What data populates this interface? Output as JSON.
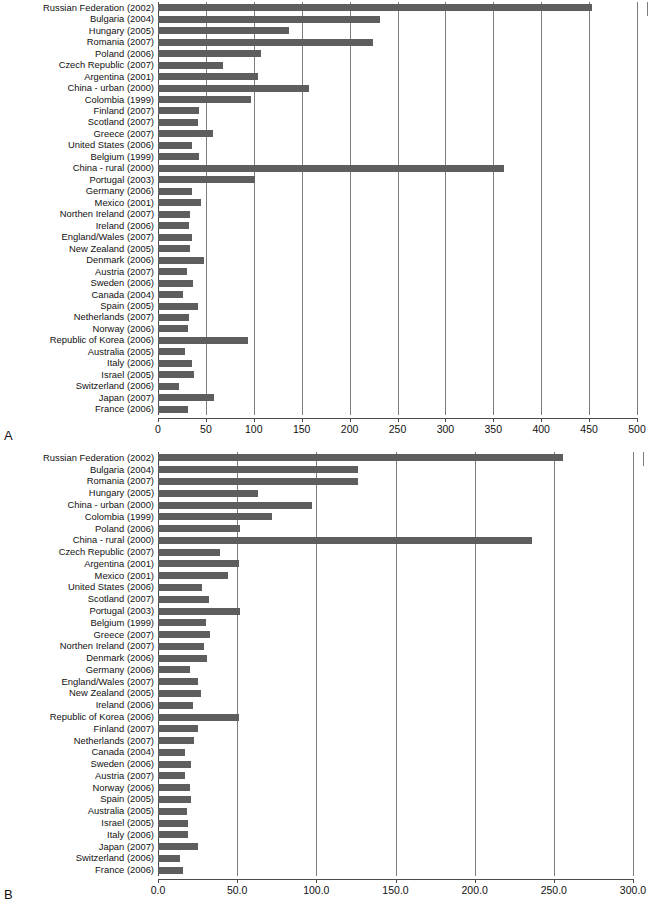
{
  "figure": {
    "panels": [
      {
        "letter": "A"
      },
      {
        "letter": "B"
      }
    ]
  },
  "chart_data": [
    {
      "panel": "A",
      "type": "bar",
      "orientation": "horizontal",
      "title": "",
      "xlabel": "",
      "ylabel": "",
      "xlim": [
        0,
        500
      ],
      "xticks": [
        0,
        50,
        100,
        150,
        200,
        250,
        300,
        350,
        400,
        450,
        500
      ],
      "xticklabels": [
        "0",
        "50",
        "100",
        "150",
        "200",
        "250",
        "300",
        "350",
        "400",
        "450",
        "500"
      ],
      "grid": true,
      "legend": "none",
      "bar_color": "#5e5e5e",
      "categories": [
        "Russian Federation (2002)",
        "Bulgaria (2004)",
        "Hungary (2005)",
        "Romania (2007)",
        "Poland (2006)",
        "Czech Republic (2007)",
        "Argentina (2001)",
        "China - urban (2000)",
        "Colombia (1999)",
        "Finland (2007)",
        "Scotland (2007)",
        "Greece (2007)",
        "United States (2006)",
        "Belgium (1999)",
        "China - rural (2000)",
        "Portugal (2003)",
        "Germany (2006)",
        "Mexico (2001)",
        "Northen Ireland (2007)",
        "Ireland (2006)",
        "England/Wales (2007)",
        "New Zealand (2005)",
        "Denmark (2006)",
        "Austria (2007)",
        "Sweden (2006)",
        "Canada (2004)",
        "Spain (2005)",
        "Netherlands (2007)",
        "Norway (2006)",
        "Republic of Korea (2006)",
        "Australia (2005)",
        "Italy (2006)",
        "Israel (2005)",
        "Switzerland (2006)",
        "Japan (2007)",
        "France (2006)"
      ],
      "values": [
        453,
        232,
        137,
        224,
        108,
        68,
        104,
        158,
        97,
        43,
        42,
        57,
        36,
        43,
        361,
        101,
        35,
        45,
        33,
        32,
        36,
        33,
        48,
        30,
        37,
        26,
        42,
        32,
        31,
        94,
        28,
        36,
        38,
        22,
        58,
        31
      ]
    },
    {
      "panel": "B",
      "type": "bar",
      "orientation": "horizontal",
      "title": "",
      "xlabel": "",
      "ylabel": "",
      "xlim": [
        0,
        300
      ],
      "xticks": [
        0,
        50,
        100,
        150,
        200,
        250,
        300
      ],
      "xticklabels": [
        "0.0",
        "50.0",
        "100.0",
        "150.0",
        "200.0",
        "250.0",
        "300.0"
      ],
      "grid": true,
      "legend": "none",
      "bar_color": "#5e5e5e",
      "categories": [
        "Russian Federation (2002)",
        "Bulgaria (2004)",
        "Romania (2007)",
        "Hungary (2005)",
        "China - urban (2000)",
        "Colombia (1999)",
        "Poland (2006)",
        "China - rural (2000)",
        "Czech Republic (2007)",
        "Argentina (2001)",
        "Mexico (2001)",
        "United States (2006)",
        "Scotland (2007)",
        "Portugal (2003)",
        "Belgium (1999)",
        "Greece (2007)",
        "Northen Ireland (2007)",
        "Denmark (2006)",
        "Germany (2006)",
        "England/Wales (2007)",
        "New Zealand (2005)",
        "Ireland (2006)",
        "Republic of Korea (2006)",
        "Finland (2007)",
        "Netherlands (2007)",
        "Canada (2004)",
        "Sweden (2006)",
        "Austria (2007)",
        "Norway (2006)",
        "Spain (2005)",
        "Australia (2005)",
        "Israel (2005)",
        "Italy (2006)",
        "Japan (2007)",
        "Switzerland (2006)",
        "France (2006)"
      ],
      "values": [
        256,
        126,
        126,
        63,
        97,
        72,
        52,
        236,
        39,
        51,
        44,
        28,
        32,
        52,
        30,
        33,
        29,
        31,
        20,
        25,
        27,
        22,
        51,
        25,
        23,
        17,
        21,
        17,
        20,
        21,
        18,
        19,
        19,
        25,
        14,
        16
      ]
    }
  ]
}
